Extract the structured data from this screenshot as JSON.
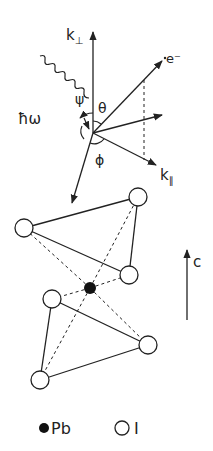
{
  "diagram": {
    "type": "photoemission-geometry-and-crystal-structure",
    "colors": {
      "line": "#222222",
      "background": "#ffffff",
      "pb_atom": "#111111",
      "i_atom_fill": "#ffffff"
    },
    "vectors": {
      "k_perp": {
        "label": "k",
        "subscript": "⊥"
      },
      "k_par": {
        "label": "k",
        "subscript": "∥"
      },
      "electron": {
        "label": "e⁻"
      },
      "photon": {
        "label": "ħω"
      }
    },
    "angles": {
      "psi": "ψ",
      "theta": "θ",
      "phi": "ϕ"
    },
    "crystal_axis": {
      "label": "c"
    },
    "legend": [
      {
        "symbol": "filled-circle",
        "label": "Pb"
      },
      {
        "symbol": "open-circle",
        "label": "I"
      }
    ]
  }
}
